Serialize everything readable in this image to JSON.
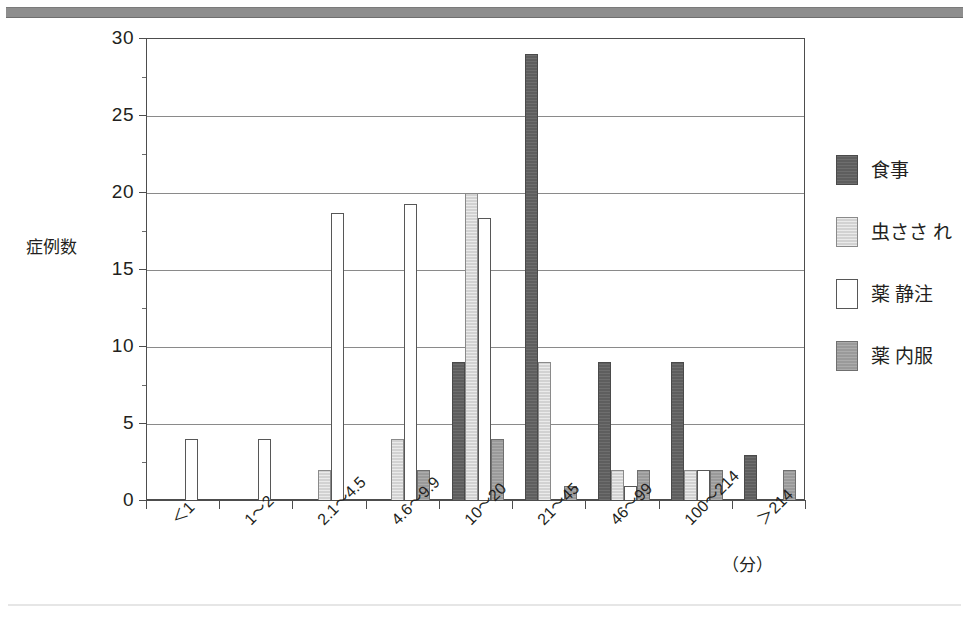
{
  "figure": {
    "top_rule_color": "#8e8e8e",
    "background_color": "#ffffff"
  },
  "axis": {
    "y_title": "症例数",
    "x_unit": "（分）",
    "y_ticks": [
      "0",
      "5",
      "10",
      "15",
      "20",
      "25",
      "30"
    ]
  },
  "legend": {
    "position": "right",
    "items": [
      {
        "label": "食事",
        "key": "meal",
        "color": "#5e5e5e"
      },
      {
        "label": "虫ささ れ",
        "key": "bite",
        "color": "#d2d2d2"
      },
      {
        "label": "薬 静注",
        "key": "iv",
        "color": "#ffffff"
      },
      {
        "label": "薬 内服",
        "key": "oral",
        "color": "#9a9a9a"
      }
    ]
  },
  "chart_data": {
    "type": "bar",
    "title": "",
    "xlabel": "（分）",
    "ylabel": "症例数",
    "ylim": [
      0,
      30
    ],
    "ytick_step": 5,
    "grid": true,
    "legend_position": "right",
    "categories": [
      "＜1",
      "1〜2",
      "2.1〜4.5",
      "4.6〜9.9",
      "10〜20",
      "21〜45",
      "46〜99",
      "100〜214",
      "＞214"
    ],
    "series": [
      {
        "name": "食事",
        "key": "meal",
        "color": "#5e5e5e",
        "values": [
          0,
          0,
          0,
          0,
          9,
          29,
          9,
          9,
          3
        ]
      },
      {
        "name": "虫ささ れ",
        "key": "bite",
        "color": "#d2d2d2",
        "values": [
          0,
          0,
          2,
          4,
          20,
          9,
          2,
          2,
          0
        ]
      },
      {
        "name": "薬 静注",
        "key": "iv",
        "color": "#ffffff",
        "values": [
          4,
          4,
          18.7,
          19.3,
          18.4,
          0,
          1,
          2,
          0
        ]
      },
      {
        "name": "薬 内服",
        "key": "oral",
        "color": "#9a9a9a",
        "values": [
          0,
          0,
          0,
          2,
          4,
          1,
          2,
          2,
          2
        ]
      }
    ]
  }
}
